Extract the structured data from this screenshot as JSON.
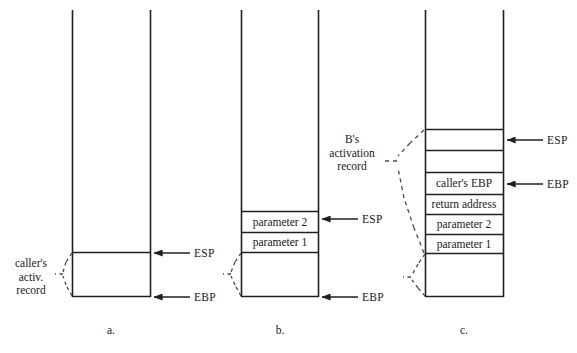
{
  "figure": {
    "background": "#ffffff",
    "line_color": "#202020",
    "dash_color": "#4a4a4a"
  },
  "panels": [
    {
      "id": "a",
      "caption": "a.",
      "note": "caller's\nactiv.\nrecord",
      "note_lines": [
        "caller's",
        "activ.",
        "record"
      ],
      "cells": [],
      "registers": [
        {
          "name": "ESP",
          "label": "ESP"
        },
        {
          "name": "EBP",
          "label": "EBP"
        }
      ]
    },
    {
      "id": "b",
      "caption": "b.",
      "note": "B's\nactivation\nrecord",
      "note_lines": [
        "B's",
        "activation",
        "record"
      ],
      "cells": [
        {
          "label": "parameter 2"
        },
        {
          "label": "parameter 1"
        },
        {
          "label": ""
        }
      ],
      "registers": [
        {
          "name": "ESP",
          "label": "ESP"
        },
        {
          "name": "EBP",
          "label": "EBP"
        }
      ]
    },
    {
      "id": "c",
      "caption": "c.",
      "note": "",
      "note_lines": [],
      "cells": [
        {
          "label": ""
        },
        {
          "label": ""
        },
        {
          "label": "caller's EBP"
        },
        {
          "label": "return address"
        },
        {
          "label": "parameter 2"
        },
        {
          "label": "parameter 1"
        },
        {
          "label": ""
        }
      ],
      "registers": [
        {
          "name": "ESP",
          "label": "ESP"
        },
        {
          "name": "EBP",
          "label": "EBP"
        }
      ]
    }
  ],
  "labels": {
    "caller_note_line1": "caller's",
    "caller_note_line2": "activ.",
    "caller_note_line3": "record",
    "b_note_line1": "B's",
    "b_note_line2": "activation",
    "b_note_line3": "record",
    "panel_a_caption": "a.",
    "panel_b_caption": "b.",
    "panel_c_caption": "c.",
    "esp_a": "ESP",
    "ebp_a": "EBP",
    "esp_b": "ESP",
    "ebp_b": "EBP",
    "esp_c": "ESP",
    "ebp_c": "EBP",
    "cell_b_param2": "parameter 2",
    "cell_b_param1": "parameter 1",
    "cell_c_callers_ebp": "caller's EBP",
    "cell_c_return_address": "return address",
    "cell_c_param2": "parameter 2",
    "cell_c_param1": "parameter 1"
  }
}
